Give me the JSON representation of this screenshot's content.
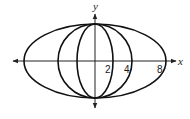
{
  "diagram": {
    "type": "coordinate-plot-of-ellipses",
    "axes": {
      "x_label": "x",
      "y_label": "y",
      "origin_px": [
        95,
        61
      ],
      "x_extent_px": [
        13,
        176
      ],
      "y_extent_px": [
        14,
        108
      ],
      "arrows": "both-ends"
    },
    "tick_labels": [
      {
        "text": "2",
        "x": 105,
        "y": 73
      },
      {
        "text": "4",
        "x": 124,
        "y": 73
      },
      {
        "text": "8",
        "x": 157,
        "y": 73
      }
    ],
    "ellipses": [
      {
        "name": "ellipse-a2",
        "semi_x_px": 18,
        "semi_y_px": 37,
        "x_intercept": "2"
      },
      {
        "name": "ellipse-a4",
        "semi_x_px": 37,
        "semi_y_px": 37,
        "x_intercept": "4"
      },
      {
        "name": "ellipse-a8",
        "semi_x_px": 71,
        "semi_y_px": 37,
        "x_intercept": "8"
      }
    ],
    "colors": {
      "stroke": "#111111",
      "background": "#ffffff"
    }
  }
}
